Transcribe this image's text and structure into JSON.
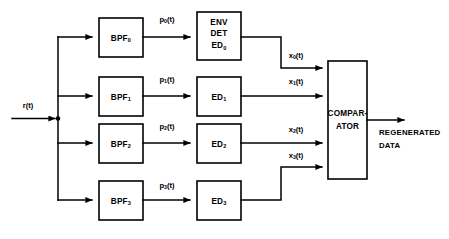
{
  "diagram": {
    "input": {
      "label": "r(t)",
      "label_base": "r",
      "label_tail": "(t)"
    },
    "output": {
      "line1": "REGENERATED",
      "line2": "DATA"
    },
    "comparator": {
      "line1": "COMPAR-",
      "line2": "ATOR"
    },
    "branches": [
      {
        "filter_base": "BPF",
        "filter_sub": "0",
        "mid_base": "p",
        "mid_sub": "0",
        "mid_tail": "(t)",
        "detector_line1": "ENV",
        "detector_line2": "DET",
        "detector_base": "ED",
        "detector_sub": "0",
        "out_base": "x",
        "out_sub": "0",
        "out_tail": "(t)"
      },
      {
        "filter_base": "BPF",
        "filter_sub": "1",
        "mid_base": "p",
        "mid_sub": "1",
        "mid_tail": "(t)",
        "detector_base": "ED",
        "detector_sub": "1",
        "out_base": "x",
        "out_sub": "1",
        "out_tail": "(t)"
      },
      {
        "filter_base": "BPF",
        "filter_sub": "2",
        "mid_base": "p",
        "mid_sub": "2",
        "mid_tail": "(t)",
        "detector_base": "ED",
        "detector_sub": "2",
        "out_base": "x",
        "out_sub": "2",
        "out_tail": "(t)"
      },
      {
        "filter_base": "BPF",
        "filter_sub": "3",
        "mid_base": "p",
        "mid_sub": "3",
        "mid_tail": "(t)",
        "detector_base": "ED",
        "detector_sub": "3",
        "out_base": "x",
        "out_sub": "3",
        "out_tail": "(t)"
      }
    ]
  },
  "colors": {
    "stroke": "#000000",
    "background": "#ffffff"
  }
}
